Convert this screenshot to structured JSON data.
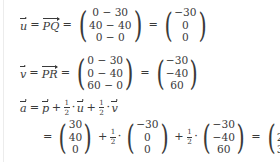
{
  "document": {
    "type": "handwritten-style math worksheet",
    "subject": "vector computation",
    "background_color": "#ffffff",
    "text_color": "#3a3a3a",
    "rule_color": "#ececec"
  },
  "symbols": {
    "u": "u",
    "v": "v",
    "a": "a",
    "p": "p",
    "PQ": "PQ",
    "PR": "PR",
    "equals": "=",
    "plus": "+",
    "dot": "·",
    "minus": "−",
    "half_numerator": "1",
    "half_denominator": "2"
  },
  "lines": [
    {
      "id": "line-u",
      "label_vector": "u",
      "label_points": "PQ",
      "expression_vector": {
        "rows": [
          "0 − 30",
          "40 − 40",
          "0 − 0"
        ]
      },
      "result_vector": {
        "rows": [
          "−30",
          "0",
          "0"
        ]
      }
    },
    {
      "id": "line-v",
      "label_vector": "v",
      "label_points": "PR",
      "expression_vector": {
        "rows": [
          "0 − 30",
          "0 − 40",
          "60 − 0"
        ]
      },
      "result_vector": {
        "rows": [
          "−30",
          "−40",
          "60"
        ]
      }
    },
    {
      "id": "line-a-formula",
      "label_vector": "a",
      "term_1_vector": "p",
      "term_2_vector": "u",
      "term_3_vector": "v",
      "coefficient": "1/2"
    },
    {
      "id": "line-a-computation",
      "vector_p": {
        "rows": [
          "30",
          "40",
          "0"
        ]
      },
      "vector_u": {
        "rows": [
          "−30",
          "0",
          "0"
        ]
      },
      "vector_v": {
        "rows": [
          "−30",
          "−40",
          "60"
        ]
      },
      "result_vector": {
        "rows": [
          "0",
          "20",
          "30"
        ]
      }
    }
  ]
}
